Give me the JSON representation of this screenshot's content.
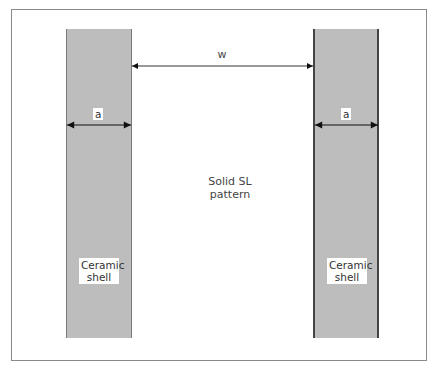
{
  "diagram": {
    "frame": {
      "border_color": "#8a8a8a"
    },
    "shell_color": "#bdbdbd",
    "left_shell": {
      "label_line1": "Ceramic",
      "label_line2": "shell",
      "dimension_label": "a"
    },
    "right_shell": {
      "label_line1": "Ceramic",
      "label_line2": "shell",
      "dimension_label": "a"
    },
    "gap": {
      "dimension_label": "w"
    },
    "center_label": {
      "line1": "Solid SL",
      "line2": "pattern"
    }
  }
}
